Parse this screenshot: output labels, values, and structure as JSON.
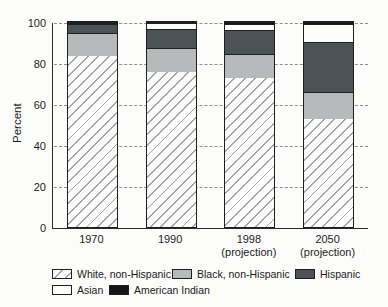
{
  "chart_data": {
    "type": "stacked-bar",
    "title": "",
    "xlabel": "",
    "ylabel": "Percent",
    "ylim": [
      0,
      100
    ],
    "yticks": [
      0,
      20,
      40,
      60,
      80,
      100
    ],
    "grid": "dashed horizontal",
    "legend_position": "bottom",
    "categories": [
      "1970",
      "1990",
      "1998\n(projection)",
      "2050\n(projection)"
    ],
    "series": [
      {
        "name": "White, non-Hispanic",
        "style": "hatch",
        "values": [
          83.5,
          75.7,
          72.5,
          52.8
        ]
      },
      {
        "name": "Black, non-Hispanic",
        "style": "lightgray",
        "values": [
          10.9,
          11.8,
          12.1,
          13.2
        ]
      },
      {
        "name": "Hispanic",
        "style": "darkgray",
        "values": [
          4.4,
          9.0,
          11.3,
          24.3
        ]
      },
      {
        "name": "Asian",
        "style": "white",
        "values": [
          0.8,
          2.8,
          3.3,
          8.9
        ]
      },
      {
        "name": "American Indian",
        "style": "black",
        "values": [
          0.4,
          0.7,
          0.8,
          0.8
        ]
      }
    ],
    "legend_rows": [
      [
        "White, non-Hispanic",
        "Black, non-Hispanic",
        "Hispanic"
      ],
      [
        "Asian",
        "American Indian"
      ]
    ],
    "colors": {
      "hatch_line": "#a0a5a8",
      "lightgray": "#b7babb",
      "darkgray": "#4c5356",
      "white_fill": "#fdfdfc",
      "black_fill": "#151515",
      "border": "#1f1f1f",
      "gridline": "#8f8f8f"
    }
  }
}
